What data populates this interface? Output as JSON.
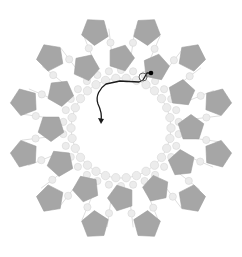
{
  "diagram": {
    "center": [
      121,
      128
    ],
    "colors": {
      "pentagon": "#a6a6a6",
      "bead": "#ececec",
      "thread": "#1a1a1a",
      "knot": "#000000"
    },
    "outer_ring": {
      "count": 12,
      "radius": 100,
      "start_angle_deg": -75,
      "pentagon_size": 14
    },
    "inner_ring": {
      "count": 12,
      "radius": 70,
      "start_angle_deg": -90,
      "pentagon_size": 13.5
    },
    "bead_ring": {
      "count": 30,
      "radius": 50,
      "bead_r": 4.2
    },
    "bridge_beads": {
      "radius": 86,
      "bead_r": 3.6,
      "count": 24
    },
    "thread_path": {
      "knot": [
        151,
        73
      ],
      "points": "M151,73 L147,73 L143,80 L139,82 L120,81 L106,84 C100,88 95,96 98,104 C101,110 102,115 101,121",
      "loop": [
        143,
        77,
        4
      ],
      "arrow_tip": [
        101,
        124
      ]
    }
  }
}
